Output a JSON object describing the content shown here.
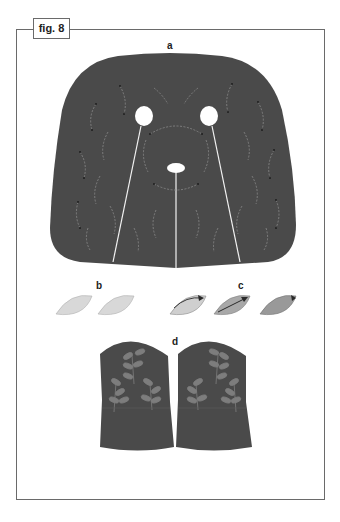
{
  "figure": {
    "label": "fig. 8",
    "panels": [
      {
        "id": "a",
        "label": "a",
        "description": "mask face panel with eye and nose openings, embroidered stitch curves and seam lines"
      },
      {
        "id": "b",
        "label": "b",
        "description": "two plain leaf shapes"
      },
      {
        "id": "c",
        "label": "c",
        "description": "three leaf shapes showing stitching direction with arrows"
      },
      {
        "id": "d",
        "label": "d",
        "description": "pair of mitten/cuff pieces embroidered with leaf sprigs"
      }
    ]
  },
  "colors": {
    "fabric": "#4a4a4a",
    "stitch": "#8a8a8a",
    "leaf_light": "#d8d8d8",
    "leaf_mid": "#a8a8a8",
    "frame": "#6a6a6a",
    "background": "#ffffff"
  }
}
